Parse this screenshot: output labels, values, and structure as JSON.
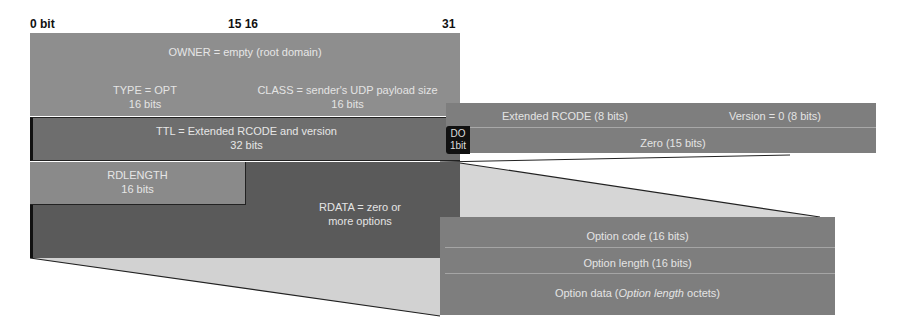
{
  "diagram": {
    "bit_labels": [
      "0 bit",
      "15 16",
      "31"
    ],
    "rr": {
      "owner": "OWNER = empty (root domain)",
      "type": {
        "line1": "TYPE = OPT",
        "line2": "16 bits"
      },
      "class": {
        "line1": "CLASS = sender's UDP payload size",
        "line2": "16 bits"
      },
      "ttl": {
        "line1": "TTL = Extended RCODE and version",
        "line2": "32 bits"
      },
      "rdlength": {
        "line1": "RDLENGTH",
        "line2": "16 bits"
      },
      "rdata": {
        "line1": "RDATA = zero or",
        "line2": "more options"
      }
    },
    "ttl_detail": {
      "extended_rcode": "Extended RCODE (8 bits)",
      "version": "Version = 0 (8 bits)",
      "do_flag": {
        "line1": "DO",
        "line2": "1bit"
      },
      "zero": "Zero (15 bits)"
    },
    "option_detail": {
      "code": "Option code (16 bits)",
      "length": "Option length (16 bits)",
      "data_prefix": "Option data (",
      "data_italic": "Option length",
      "data_suffix": " octets)"
    },
    "colors": {
      "light_gray": "#8f8f8f",
      "mid_gray": "#7a7a7a",
      "dark_gray": "#5e5e5e",
      "connector_fill": "#d8d8d8",
      "do_flag": "#111111"
    }
  }
}
